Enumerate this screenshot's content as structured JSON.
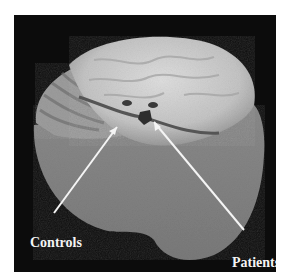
{
  "figure": {
    "background_color": "#0c0c0c",
    "annotations": [
      {
        "label": "Controls",
        "arrow_target": "left ventricle region"
      },
      {
        "label": "Patients",
        "arrow_target": "right ventricle region"
      }
    ]
  }
}
